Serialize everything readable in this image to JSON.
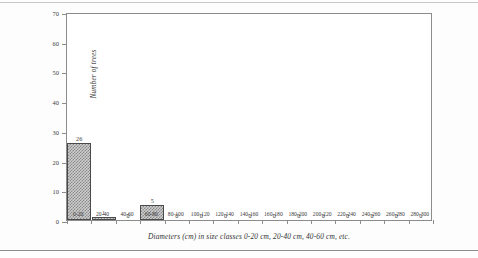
{
  "chart_data": {
    "type": "bar",
    "title": "",
    "xlabel": "Diameters (cm) in size classes 0-20 cm, 20-40 cm, 40-60 cm, etc.",
    "ylabel": "Number of trees",
    "categories": [
      "0-20",
      "20-40",
      "40-60",
      "60-80",
      "80-100",
      "100-120",
      "120-140",
      "140-160",
      "160-180",
      "180-200",
      "200-220",
      "220-240",
      "240-260",
      "260-280",
      "280-300"
    ],
    "values": [
      26,
      1,
      0,
      5,
      0,
      0,
      0,
      0,
      0,
      0,
      0,
      0,
      0,
      0,
      0
    ],
    "value_labels": [
      "26",
      "1",
      "0",
      "5",
      "0",
      "0",
      "0",
      "0",
      "0",
      "0",
      "0",
      "0",
      "0",
      "0",
      "0"
    ],
    "ylim": [
      0,
      70
    ],
    "yticks": [
      0,
      10,
      20,
      30,
      40,
      50,
      60,
      70
    ],
    "ytick_labels": [
      "0",
      "10",
      "20",
      "30",
      "40",
      "50",
      "60",
      "70"
    ],
    "grid": false,
    "legend": "none",
    "bar_fill": "#cdcdcd",
    "bar_hatch_color": "#8a8a8a",
    "bar_border": "#4a4a4a",
    "axis_color": "#8c8c8c"
  }
}
